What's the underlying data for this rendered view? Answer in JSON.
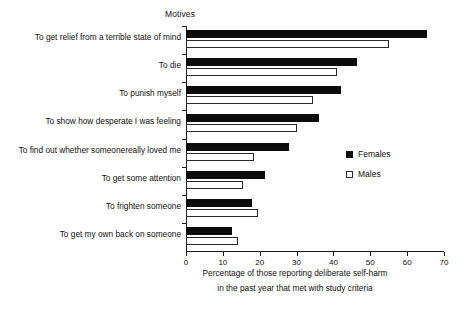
{
  "chart_data": {
    "type": "bar",
    "orientation": "horizontal",
    "title": "Motives",
    "xlabel_lines": [
      "Percentage of those reporting deliberate self-harm",
      "in the past year that met with study criteria"
    ],
    "ylabel": "",
    "xlim": [
      0,
      70
    ],
    "xticks": [
      0,
      10,
      20,
      30,
      40,
      50,
      60,
      70
    ],
    "xtick_labels": [
      "0",
      "10",
      "20",
      "30",
      "40",
      "50",
      "60",
      "70"
    ],
    "grid": false,
    "legend_position": "right-middle",
    "categories": [
      "To get relief from a terrible state of mind",
      "To die",
      "To punish myself",
      "To show how desperate I was feeling",
      "To find out whether someonereally loved me",
      "To get some attention",
      "To frighten someone",
      "To get my own back on someone"
    ],
    "series": [
      {
        "name": "Females",
        "color": "#0b0b0b",
        "style": "filled",
        "values": [
          65.5,
          46.5,
          42.0,
          36.0,
          28.0,
          21.5,
          18.0,
          12.5
        ]
      },
      {
        "name": "Males",
        "color": "#ffffff",
        "style": "hollow",
        "values": [
          55.0,
          41.0,
          34.5,
          30.0,
          18.5,
          15.5,
          19.5,
          14.0
        ]
      }
    ]
  },
  "legend": {
    "entries": [
      {
        "label": "Females",
        "style": "filled"
      },
      {
        "label": "Males",
        "style": "hollow"
      }
    ]
  }
}
